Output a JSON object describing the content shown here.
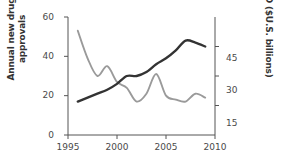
{
  "chart_data": {
    "type": "line",
    "title": "",
    "xlabel": "",
    "x": [
      1996,
      1997,
      1998,
      1999,
      2000,
      2001,
      2002,
      2003,
      2004,
      2005,
      2006,
      2007,
      2008,
      2009
    ],
    "xlim": [
      1995,
      2010
    ],
    "xticks": [
      1995,
      2000,
      2005,
      2010
    ],
    "xtick_labels": [
      "1995",
      "2000",
      "2005",
      "2010"
    ],
    "grid": false,
    "legend": "none",
    "axes": [
      {
        "id": "left",
        "label": "Annual new drug approvals",
        "label_line1": "Annual new drug",
        "label_line2": "approvals",
        "lim": [
          0,
          60
        ],
        "ticks": [
          0,
          20,
          40,
          60
        ],
        "tick_labels": [
          "0",
          "20",
          "40",
          "60"
        ]
      },
      {
        "id": "right",
        "label": "R&D ($U.S. billions)",
        "lim": [
          0,
          60
        ],
        "ticks": [
          15,
          30,
          45
        ],
        "tick_labels": [
          "15",
          "30",
          "45"
        ]
      }
    ],
    "series": [
      {
        "name": "Annual new drug approvals",
        "axis": "left",
        "color": "#9a9a9a",
        "values": [
          53,
          39,
          30,
          35,
          27,
          24,
          17,
          21,
          31,
          20,
          18,
          17,
          21,
          19
        ]
      },
      {
        "name": "R&D ($U.S. billions)",
        "axis": "right",
        "color": "#333333",
        "values": [
          17,
          19,
          21,
          23,
          26,
          30,
          30,
          32,
          36,
          39,
          43,
          48,
          47,
          45
        ]
      }
    ]
  }
}
